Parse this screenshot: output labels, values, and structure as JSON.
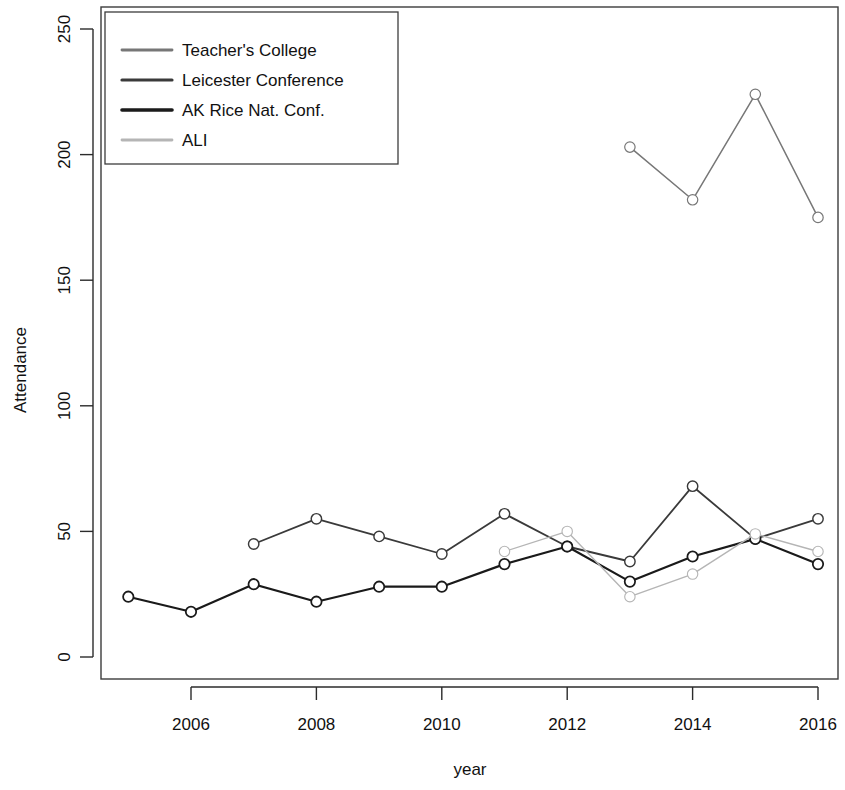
{
  "chart_data": {
    "type": "line",
    "title": "",
    "xlabel": "year",
    "ylabel": "Attendance",
    "xlim": [
      2004.6,
      2016.6
    ],
    "ylim": [
      0,
      258
    ],
    "xticks": [
      2006,
      2008,
      2010,
      2012,
      2014,
      2016
    ],
    "xtick_labels": [
      "2006",
      "2008",
      "2010",
      "2012",
      "2014",
      "2016"
    ],
    "yticks": [
      0,
      50,
      100,
      150,
      200,
      250
    ],
    "ytick_labels": [
      "0",
      "50",
      "100",
      "150",
      "200",
      "250"
    ],
    "grid": false,
    "legend_position": "top-left",
    "series": [
      {
        "name": "Teacher's College",
        "color": "#777777",
        "line_width": 1.5,
        "marker": "circle",
        "x": [
          2013,
          2014,
          2015,
          2016
        ],
        "values": [
          203,
          182,
          224,
          175
        ]
      },
      {
        "name": "Leicester Conference",
        "color": "#3a3a3a",
        "line_width": 1.8,
        "marker": "circle",
        "x": [
          2007,
          2008,
          2009,
          2010,
          2011,
          2012,
          2013,
          2014,
          2015,
          2016
        ],
        "values": [
          45,
          55,
          48,
          41,
          57,
          44,
          38,
          68,
          47,
          55
        ]
      },
      {
        "name": "AK Rice Nat. Conf.",
        "color": "#1a1a1a",
        "line_width": 2.2,
        "marker": "circle",
        "x": [
          2005,
          2006,
          2007,
          2008,
          2009,
          2010,
          2011,
          2012,
          2013,
          2014,
          2015,
          2016
        ],
        "values": [
          24,
          18,
          29,
          22,
          28,
          28,
          37,
          44,
          30,
          40,
          47,
          37
        ]
      },
      {
        "name": "ALI",
        "color": "#b5b5b5",
        "line_width": 1.4,
        "marker": "circle",
        "x": [
          2011,
          2012,
          2013,
          2014,
          2015,
          2016
        ],
        "values": [
          42,
          50,
          24,
          33,
          49,
          42
        ]
      }
    ]
  },
  "legend": {
    "entries": [
      {
        "label": "Teacher's College"
      },
      {
        "label": "Leicester Conference"
      },
      {
        "label": "AK Rice Nat. Conf."
      },
      {
        "label": "ALI"
      }
    ]
  }
}
